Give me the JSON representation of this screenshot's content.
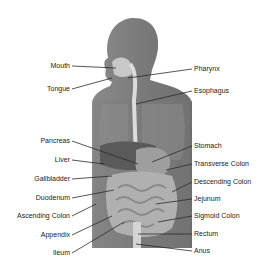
{
  "diagram": {
    "title": "",
    "colors": {
      "background": "#ffffff",
      "body": "#7a7a7a",
      "body_dark": "#5e5e5e",
      "organ_light": "#bdbdbd",
      "organ_mid": "#9a9a9a",
      "leader_line": "#2a2a2a",
      "text": "#1a1a1a"
    },
    "labels_left": [
      {
        "text": "Mouth",
        "y": 66
      },
      {
        "text": "Tongue",
        "y": 89
      },
      {
        "text": "Pancreas",
        "y": 141
      },
      {
        "text": "Liver",
        "y": 160
      },
      {
        "text": "Gallbladder",
        "y": 179
      },
      {
        "text": "Duodenum",
        "y": 198
      },
      {
        "text": "Ascending Colon",
        "y": 216
      },
      {
        "text": "Appendix",
        "y": 235
      },
      {
        "text": "Ileum",
        "y": 253
      }
    ],
    "labels_right": [
      {
        "text": "Pharynx",
        "y": 69
      },
      {
        "text": "Esophagus",
        "y": 91
      },
      {
        "text": "Stomach",
        "y": 146
      },
      {
        "text": "Transverse Colon",
        "y": 164
      },
      {
        "text": "Descending Colon",
        "y": 182
      },
      {
        "text": "Jejunum",
        "y": 199
      },
      {
        "text": "Sigmoid Colon",
        "y": 216
      },
      {
        "text": "Rectum",
        "y": 234
      },
      {
        "text": "Anus",
        "y": 251
      }
    ]
  }
}
